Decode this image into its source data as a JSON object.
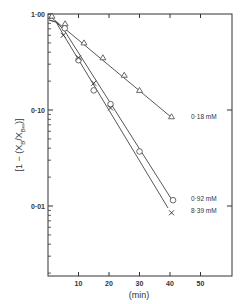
{
  "chart_data": {
    "type": "scatter",
    "title": "",
    "xlabel": "(min)",
    "ylabel": "[1 − (X_B / X_B∞)]",
    "ylabel_parts": {
      "open": "[",
      "one_minus": "1 − (",
      "x": "X",
      "sub_b": "B",
      "slash": "/",
      "x2": "X",
      "sub_binf": "B∞",
      "close_paren": ")",
      "close": "]"
    },
    "xlim": [
      0,
      60
    ],
    "ylim": [
      0.002,
      1.0
    ],
    "yscale": "log",
    "grid": false,
    "x_ticks": [
      10,
      20,
      30,
      40,
      50
    ],
    "x_tick_labels": [
      "10",
      "20",
      "30",
      "40",
      "50"
    ],
    "y_ticks": [
      1.0,
      0.1,
      0.01
    ],
    "y_tick_labels": [
      "1·00",
      "0·10",
      "0·01"
    ],
    "legend": "inline labels at line ends",
    "series": [
      {
        "name": "0·18 mM",
        "marker": "triangle",
        "x": [
          1.3,
          5.6,
          11.8,
          18,
          25,
          30,
          40.5
        ],
        "values": [
          0.95,
          0.79,
          0.5,
          0.35,
          0.23,
          0.16,
          0.085
        ]
      },
      {
        "name": "0·92 mM",
        "marker": "circle",
        "x": [
          5.5,
          10,
          15,
          20.5,
          30,
          41
        ],
        "values": [
          0.71,
          0.33,
          0.16,
          0.115,
          0.037,
          0.0115
        ]
      },
      {
        "name": "8·39 mM",
        "marker": "cross",
        "x": [
          5,
          10,
          15,
          20.5,
          40.5
        ],
        "values": [
          0.6,
          0.35,
          0.19,
          0.105,
          0.0085
        ]
      }
    ]
  }
}
